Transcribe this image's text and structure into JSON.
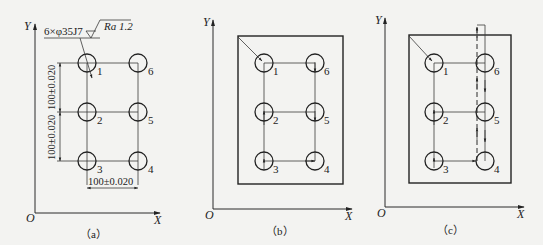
{
  "figure": {
    "panels": [
      {
        "id": "a",
        "caption": "（a）",
        "axis_x": "X",
        "axis_y": "Y",
        "origin": "O",
        "hole_labels": [
          "1",
          "2",
          "3",
          "4",
          "5",
          "6"
        ],
        "hole_callout": "6×φ35J7",
        "roughness": "Ra 1.2",
        "dim_horizontal": "100±0.020",
        "dim_vertical_upper": "100±0.020",
        "dim_vertical_lower": "100±0.020"
      },
      {
        "id": "b",
        "caption": "（b）",
        "axis_x": "X",
        "axis_y": "Y",
        "origin": "O",
        "hole_labels": [
          "1",
          "2",
          "3",
          "4",
          "5",
          "6"
        ],
        "path_order": [
          "1",
          "2",
          "3",
          "4",
          "5",
          "6"
        ]
      },
      {
        "id": "c",
        "caption": "（c）",
        "axis_x": "X",
        "axis_y": "Y",
        "origin": "O",
        "hole_labels": [
          "1",
          "2",
          "3",
          "4",
          "5",
          "6"
        ],
        "path_order": [
          "1",
          "2",
          "3",
          "4",
          "6",
          "5"
        ]
      }
    ]
  }
}
